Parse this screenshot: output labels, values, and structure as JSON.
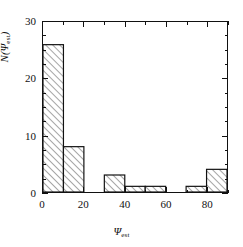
{
  "chart_data": {
    "type": "bar",
    "title": "",
    "subtitle": "",
    "xlabel": "Ψest",
    "xlabel_base": "Ψ",
    "xlabel_sub": "est",
    "ylabel": "N(Ψest)",
    "ylabel_pre": "N(",
    "ylabel_psi": "Ψ",
    "ylabel_sub": "est",
    "ylabel_post": ")",
    "bin_width": 10,
    "bin_edges": [
      0,
      10,
      20,
      30,
      40,
      50,
      60,
      70,
      80,
      90
    ],
    "categories": [
      "0-10",
      "10-20",
      "20-30",
      "30-40",
      "40-50",
      "50-60",
      "60-70",
      "70-80",
      "80-90"
    ],
    "values": [
      26,
      8,
      0,
      3,
      1,
      1,
      0,
      1,
      4
    ],
    "xlim": [
      0,
      90
    ],
    "ylim": [
      0,
      30
    ],
    "xticks": [
      0,
      20,
      40,
      60,
      80
    ],
    "xticklabels": [
      "0",
      "20",
      "40",
      "60",
      "80"
    ],
    "xticks_minor": [
      10,
      30,
      50,
      70,
      90
    ],
    "yticks": [
      0,
      10,
      20,
      30
    ],
    "yticklabels": [
      "0",
      "10",
      "20",
      "30"
    ],
    "yticks_minor": [
      2.5,
      5,
      7.5,
      12.5,
      15,
      17.5,
      22.5,
      25,
      27.5
    ],
    "grid": false,
    "legend": null,
    "bar_fill": "hatched-45-diagonal",
    "bar_edge_color": "#111111",
    "hatch_color": "#555555",
    "background_color": "#ffffff"
  }
}
